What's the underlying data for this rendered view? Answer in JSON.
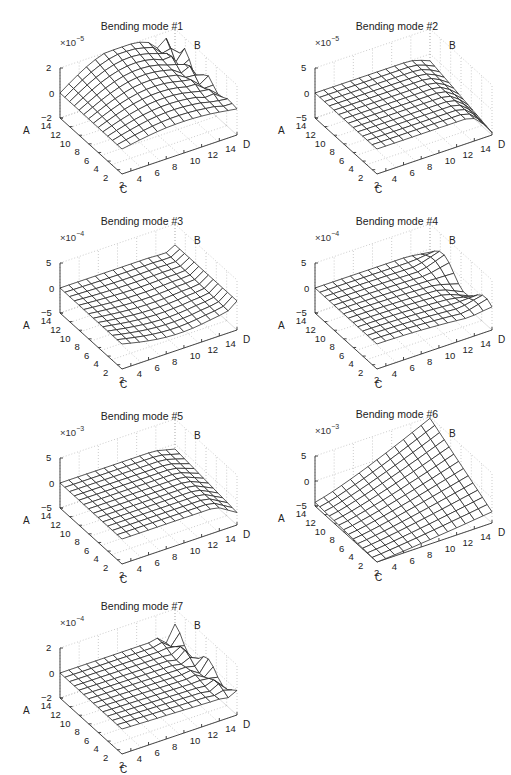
{
  "figure": {
    "panels": [
      {
        "id": 1,
        "title": "Bending mode #1",
        "scale": "×10",
        "exponent": "−5",
        "zticks": [
          "2",
          "0",
          "−2"
        ],
        "left": 0,
        "top": 0
      },
      {
        "id": 2,
        "title": "Bending mode #2",
        "scale": "×10",
        "exponent": "−5",
        "zticks": [
          "5",
          "0",
          "−5"
        ],
        "left": 255,
        "top": 0
      },
      {
        "id": 3,
        "title": "Bending mode #3",
        "scale": "×10",
        "exponent": "−4",
        "zticks": [
          "5",
          "0",
          "−5"
        ],
        "left": 0,
        "top": 195
      },
      {
        "id": 4,
        "title": "Bending mode #4",
        "scale": "×10",
        "exponent": "−4",
        "zticks": [
          "5",
          "0",
          "−5"
        ],
        "left": 255,
        "top": 195
      },
      {
        "id": 5,
        "title": "Bending mode #5",
        "scale": "×10",
        "exponent": "−3",
        "zticks": [
          "5",
          "0",
          "−5"
        ],
        "left": 0,
        "top": 390
      },
      {
        "id": 6,
        "title": "Bending mode #6",
        "scale": "×10",
        "exponent": "−3",
        "zticks": [
          "5",
          "0",
          "−5"
        ],
        "left": 255,
        "top": 388
      },
      {
        "id": 7,
        "title": "Bending mode #7",
        "scale": "×10",
        "exponent": "−4",
        "zticks": [
          "2",
          "0",
          "−2"
        ],
        "left": 0,
        "top": 580
      }
    ],
    "axis_labels": {
      "a": "A",
      "b": "B",
      "c": "C",
      "d": "D"
    },
    "x_ticks": [
      "2",
      "4",
      "6",
      "8",
      "10",
      "12",
      "14"
    ],
    "y_ticks": [
      "2",
      "4",
      "6",
      "8",
      "10",
      "12",
      "14"
    ]
  },
  "chart_data": [
    {
      "type": "surface",
      "title": "Bending mode #1",
      "xlabel": "D",
      "ylabel": "C",
      "zlabel": "A",
      "corner_label": "B",
      "zscale": "1e-5",
      "zlim": [
        -2,
        2
      ],
      "zticks": [
        -2,
        0,
        2
      ],
      "xticks": [
        2,
        4,
        6,
        8,
        10,
        12,
        14
      ],
      "yticks": [
        2,
        4,
        6,
        8,
        10,
        12,
        14
      ],
      "grid": "dotted",
      "shape": "central hump rising to ~2 along middle of D axis, oscillating ripples near D=12-14",
      "amp": 1.0,
      "mode": 1
    },
    {
      "type": "surface",
      "title": "Bending mode #2",
      "xlabel": "D",
      "ylabel": "C",
      "zlabel": "A",
      "corner_label": "B",
      "zscale": "1e-5",
      "zlim": [
        -5,
        5
      ],
      "zticks": [
        -5,
        0,
        5
      ],
      "xticks": [
        2,
        4,
        6,
        8,
        10,
        12,
        14
      ],
      "yticks": [
        2,
        4,
        6,
        8,
        10,
        12,
        14
      ],
      "grid": "dotted",
      "shape": "nearly flat near 0, dropping to ~-5 at D=13-14",
      "amp": 1.0,
      "mode": 2
    },
    {
      "type": "surface",
      "title": "Bending mode #3",
      "xlabel": "D",
      "ylabel": "C",
      "zlabel": "A",
      "corner_label": "B",
      "zscale": "1e-4",
      "zlim": [
        -5,
        5
      ],
      "zticks": [
        -5,
        0,
        5
      ],
      "xticks": [
        2,
        4,
        6,
        8,
        10,
        12,
        14
      ],
      "yticks": [
        2,
        4,
        6,
        8,
        10,
        12,
        14
      ],
      "grid": "dotted",
      "shape": "gentle trough toward high D with small oscillation at D=13-14",
      "amp": 1.0,
      "mode": 3
    },
    {
      "type": "surface",
      "title": "Bending mode #4",
      "xlabel": "D",
      "ylabel": "C",
      "zlabel": "A",
      "corner_label": "B",
      "zscale": "1e-4",
      "zlim": [
        -5,
        5
      ],
      "zticks": [
        -5,
        0,
        5
      ],
      "xticks": [
        2,
        4,
        6,
        8,
        10,
        12,
        14
      ],
      "yticks": [
        2,
        4,
        6,
        8,
        10,
        12,
        14
      ],
      "grid": "dotted",
      "shape": "slight trough at high D with a fold near D=12-14",
      "amp": 1.0,
      "mode": 4
    },
    {
      "type": "surface",
      "title": "Bending mode #5",
      "xlabel": "D",
      "ylabel": "C",
      "zlabel": "A",
      "corner_label": "B",
      "zscale": "1e-3",
      "zlim": [
        -5,
        5
      ],
      "zticks": [
        -5,
        0,
        5
      ],
      "xticks": [
        2,
        4,
        6,
        8,
        10,
        12,
        14
      ],
      "yticks": [
        2,
        4,
        6,
        8,
        10,
        12,
        14
      ],
      "grid": "dotted",
      "shape": "flat near 0 with edge trough at D=14",
      "amp": 1.0,
      "mode": 5
    },
    {
      "type": "surface",
      "title": "Bending mode #6",
      "xlabel": "D",
      "ylabel": "C",
      "zlabel": "A",
      "corner_label": "B",
      "zscale": "1e-3",
      "zlim": [
        -5,
        5
      ],
      "zticks": [
        -5,
        0,
        5
      ],
      "xticks": [
        2,
        4,
        6,
        8,
        10,
        12,
        14
      ],
      "yticks": [
        2,
        4,
        6,
        8,
        10,
        12,
        14
      ],
      "grid": "dotted",
      "shape": "tilted plane rising from ~-5 at low C/D to ~5 at high C/high D corner",
      "amp": 1.0,
      "mode": 6
    },
    {
      "type": "surface",
      "title": "Bending mode #7",
      "xlabel": "D",
      "ylabel": "C",
      "zlabel": "A",
      "corner_label": "B",
      "zscale": "1e-4",
      "zlim": [
        -2,
        2
      ],
      "zticks": [
        -2,
        0,
        2
      ],
      "xticks": [
        2,
        4,
        6,
        8,
        10,
        12,
        14
      ],
      "yticks": [
        2,
        4,
        6,
        8,
        10,
        12,
        14
      ],
      "grid": "dotted",
      "shape": "near flat with ripples near D=12-14",
      "amp": 1.0,
      "mode": 7
    }
  ]
}
